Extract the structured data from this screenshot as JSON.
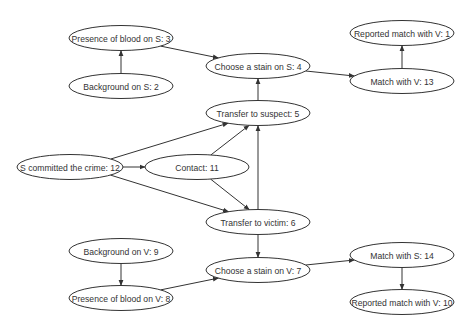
{
  "diagram": {
    "type": "directed-graph",
    "width": 473,
    "height": 326,
    "colors": {
      "stroke": "#333333",
      "fill": "#ffffff",
      "text": "#333333",
      "background": "#ffffff"
    },
    "nodes": [
      {
        "id": "n3",
        "label": "Presence of blood on S: 3",
        "cx": 121,
        "cy": 38,
        "rx": 52,
        "ry": 12.5
      },
      {
        "id": "n2",
        "label": "Background on S: 2",
        "cx": 121,
        "cy": 86,
        "rx": 52,
        "ry": 12.5
      },
      {
        "id": "n4",
        "label": "Choose a stain on S: 4",
        "cx": 258,
        "cy": 66,
        "rx": 52,
        "ry": 12.5
      },
      {
        "id": "n1",
        "label": "Reported match with V: 1",
        "cx": 402,
        "cy": 33,
        "rx": 52,
        "ry": 12.5
      },
      {
        "id": "n13",
        "label": "Match with V: 13",
        "cx": 402,
        "cy": 81,
        "rx": 52,
        "ry": 12.5
      },
      {
        "id": "n5",
        "label": "Transfer to suspect: 5",
        "cx": 258,
        "cy": 113,
        "rx": 52,
        "ry": 12.5
      },
      {
        "id": "n12",
        "label": "S committed the crime: 12",
        "cx": 70,
        "cy": 167,
        "rx": 53,
        "ry": 12.5
      },
      {
        "id": "n11",
        "label": "Contact: 11",
        "cx": 197,
        "cy": 167,
        "rx": 52,
        "ry": 12.5
      },
      {
        "id": "n6",
        "label": "Transfer to victim: 6",
        "cx": 258,
        "cy": 222,
        "rx": 52,
        "ry": 12.5
      },
      {
        "id": "n9",
        "label": "Background on V: 9",
        "cx": 121,
        "cy": 251,
        "rx": 52,
        "ry": 12.5
      },
      {
        "id": "n8",
        "label": "Presence of blood on V: 8",
        "cx": 121,
        "cy": 298,
        "rx": 52,
        "ry": 12.5
      },
      {
        "id": "n7",
        "label": "Choose a stain on V: 7",
        "cx": 258,
        "cy": 270,
        "rx": 52,
        "ry": 12.5
      },
      {
        "id": "n14",
        "label": "Match with S: 14",
        "cx": 402,
        "cy": 255,
        "rx": 52,
        "ry": 12.5
      },
      {
        "id": "n10",
        "label": "Reported match with V: 10",
        "cx": 402,
        "cy": 302,
        "rx": 52,
        "ry": 12.5
      }
    ],
    "edges": [
      {
        "from": "n2",
        "to": "n3"
      },
      {
        "from": "n3",
        "to": "n4"
      },
      {
        "from": "n5",
        "to": "n4"
      },
      {
        "from": "n4",
        "to": "n13"
      },
      {
        "from": "n13",
        "to": "n1"
      },
      {
        "from": "n12",
        "to": "n5"
      },
      {
        "from": "n12",
        "to": "n11"
      },
      {
        "from": "n12",
        "to": "n6"
      },
      {
        "from": "n11",
        "to": "n5"
      },
      {
        "from": "n11",
        "to": "n6"
      },
      {
        "from": "n6",
        "to": "n5"
      },
      {
        "from": "n6",
        "to": "n7"
      },
      {
        "from": "n9",
        "to": "n8"
      },
      {
        "from": "n8",
        "to": "n7"
      },
      {
        "from": "n7",
        "to": "n14"
      },
      {
        "from": "n14",
        "to": "n10"
      }
    ]
  }
}
